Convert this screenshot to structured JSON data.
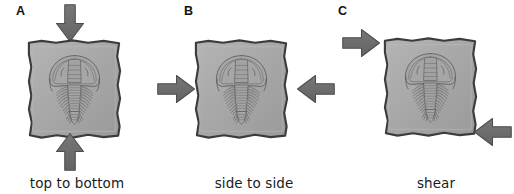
{
  "figure": {
    "background_color": "#ffffff"
  },
  "colors": {
    "arrow_fill": "#6b6b6b",
    "arrow_stroke": "#4a4a4a",
    "slab_fill": "#a9a9a9",
    "slab_stroke": "#3a3a3a",
    "fossil_line": "#5a5a5a",
    "text": "#1b1b1b"
  },
  "panels": [
    {
      "letter": "A",
      "caption": "top to bottom",
      "stress_type": "compression-vertical",
      "arrows": [
        {
          "name": "arrow-down",
          "direction": "down",
          "position": "top"
        },
        {
          "name": "arrow-up",
          "direction": "up",
          "position": "bottom"
        }
      ],
      "specimen": "trilobite-fossil",
      "slab": "rock-slab"
    },
    {
      "letter": "B",
      "caption": "side to side",
      "stress_type": "compression-horizontal",
      "arrows": [
        {
          "name": "arrow-right",
          "direction": "right",
          "position": "left"
        },
        {
          "name": "arrow-left",
          "direction": "left",
          "position": "right"
        }
      ],
      "specimen": "trilobite-fossil",
      "slab": "rock-slab"
    },
    {
      "letter": "C",
      "caption": "shear",
      "stress_type": "shear",
      "arrows": [
        {
          "name": "arrow-right",
          "direction": "right",
          "position": "top-left"
        },
        {
          "name": "arrow-left",
          "direction": "left",
          "position": "bottom-right"
        }
      ],
      "specimen": "trilobite-fossil",
      "slab": "rock-slab"
    }
  ]
}
